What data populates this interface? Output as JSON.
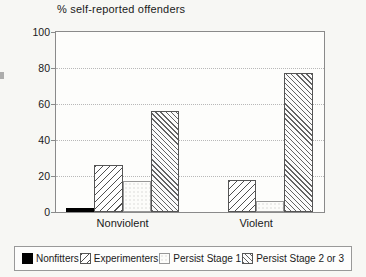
{
  "chart_data": {
    "type": "bar",
    "title": "% self-reported offenders",
    "categories": [
      "Nonviolent",
      "Violent"
    ],
    "series": [
      {
        "name": "Nonfitters",
        "pattern": "solid-black",
        "values": [
          2,
          0
        ]
      },
      {
        "name": "Experimenters",
        "pattern": "diagonal-forward-hatch",
        "values": [
          26,
          18
        ]
      },
      {
        "name": "Persist Stage 1",
        "pattern": "light-stipple",
        "values": [
          17,
          6
        ]
      },
      {
        "name": "Persist Stage 2 or 3",
        "pattern": "diagonal-back-hatch",
        "values": [
          56,
          77
        ]
      }
    ],
    "xlabel": "",
    "ylabel": "",
    "ylim": [
      0,
      100
    ],
    "yticks": [
      0,
      20,
      40,
      60,
      80,
      100
    ],
    "grid": "dotted-horizontal",
    "legend_position": "bottom",
    "colors": {
      "bar_black": "#000000",
      "hatch_line": "#4f4f4f",
      "grid_line": "#b8b8b8",
      "frame": "#8a8a8a",
      "text": "#1a1a1a",
      "background": "#f7f7f4"
    }
  }
}
